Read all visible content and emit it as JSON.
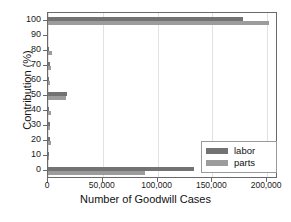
{
  "chart_data": {
    "type": "bar",
    "orientation": "horizontal",
    "title": "",
    "xlabel": "Number of Goodwill Cases",
    "ylabel": "Contribution (%)",
    "categories": [
      "0",
      "10",
      "20",
      "30",
      "40",
      "50",
      "60",
      "70",
      "80",
      "90",
      "100"
    ],
    "xlim": [
      0,
      210000
    ],
    "ylim": [
      -5,
      105
    ],
    "xticks": [
      0,
      50000,
      100000,
      150000,
      200000
    ],
    "xtick_labels": [
      "0",
      "50,000",
      "100,000",
      "150,000",
      "200,000"
    ],
    "ytick_labels": [
      "0",
      "10",
      "20",
      "30",
      "40",
      "50",
      "60",
      "70",
      "80",
      "90",
      "100"
    ],
    "grid": "vertical",
    "legend_position": "lower right",
    "series": [
      {
        "name": "labor",
        "color": "#737373",
        "values": [
          133000,
          900,
          2200,
          1700,
          1100,
          17500,
          900,
          1400,
          1100,
          0,
          178000
        ]
      },
      {
        "name": "parts",
        "color": "#9c9c9c",
        "values": [
          89000,
          700,
          3100,
          2000,
          2500,
          16500,
          1900,
          2800,
          3400,
          0,
          202000
        ]
      }
    ]
  },
  "legend": {
    "items": [
      {
        "label": "labor",
        "color": "#737373"
      },
      {
        "label": "parts",
        "color": "#9c9c9c"
      }
    ]
  }
}
